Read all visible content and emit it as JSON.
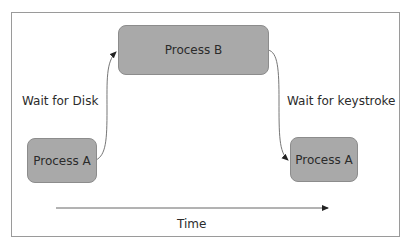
{
  "diagram": {
    "nodes": [
      {
        "id": "process-b",
        "label": "Process B"
      },
      {
        "id": "process-a-start",
        "label": "Process A"
      },
      {
        "id": "process-a-end",
        "label": "Process A"
      }
    ],
    "edges": [
      {
        "from": "process-a-start",
        "to": "process-b",
        "label": "Wait for Disk"
      },
      {
        "from": "process-b",
        "to": "process-a-end",
        "label": "Wait for keystroke"
      }
    ],
    "timeline": {
      "label": "Time"
    }
  },
  "colors": {
    "node_fill": "#a9a9a9",
    "node_border": "#8c8c8c",
    "line": "#555555",
    "frame": "#9a9a9a"
  }
}
